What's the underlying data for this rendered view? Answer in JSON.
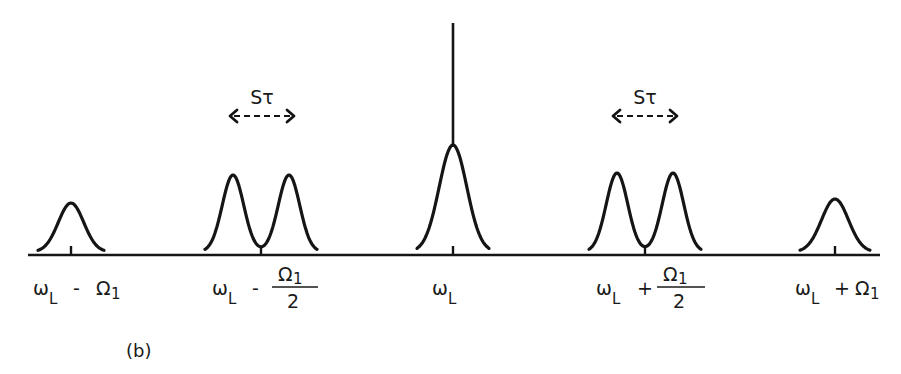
{
  "figure": {
    "panel_label": "(b)",
    "stroke_color": "#151515",
    "background": "#ffffff"
  },
  "axis": {
    "x_start": 28,
    "x_end": 880,
    "y": 255
  },
  "peaks": [
    {
      "id": "left-sideband",
      "centers": [
        71
      ],
      "top_y": 203,
      "half_width": 33,
      "tick_x": 71
    },
    {
      "id": "left-half-doublet",
      "centers": [
        233,
        289
      ],
      "top_y": 175,
      "half_width": 28,
      "tick_x": 261
    },
    {
      "id": "central",
      "centers": [
        453
      ],
      "top_y": 145,
      "half_width": 36,
      "tick_x": 453,
      "spike_top_y": 23
    },
    {
      "id": "right-half-doublet",
      "centers": [
        617,
        673
      ],
      "top_y": 173,
      "half_width": 28,
      "tick_x": 645
    },
    {
      "id": "right-sideband",
      "centers": [
        835
      ],
      "top_y": 199,
      "half_width": 35,
      "tick_x": 835
    }
  ],
  "splitting_arrows": [
    {
      "label": "Sτ",
      "center_x": 262,
      "half_length": 32,
      "y": 116,
      "label_y": 104
    },
    {
      "label": "Sτ",
      "center_x": 645,
      "half_length": 32,
      "y": 116,
      "label_y": 104
    }
  ],
  "labels": [
    {
      "id": "omega-minus-omega1",
      "omega": "ω",
      "sub": "L",
      "op": "-",
      "term": "Ω",
      "term_sub": "1",
      "fraction": false,
      "x": 33
    },
    {
      "id": "omega-minus-half-omega1",
      "omega": "ω",
      "sub": "L",
      "op": "-",
      "term": "Ω",
      "term_sub": "1",
      "fraction": true,
      "denominator": "2",
      "x": 212
    },
    {
      "id": "omega-L",
      "omega": "ω",
      "sub": "L",
      "op": "",
      "term": "",
      "term_sub": "",
      "fraction": false,
      "x": 432
    },
    {
      "id": "omega-plus-half-omega1",
      "omega": "ω",
      "sub": "L",
      "op": "+",
      "term": "Ω",
      "term_sub": "1",
      "fraction": true,
      "denominator": "2",
      "x": 596
    },
    {
      "id": "omega-plus-omega1",
      "omega": "ω",
      "sub": "L",
      "op": "+",
      "term": "Ω",
      "term_sub": "1",
      "fraction": false,
      "x": 795
    }
  ],
  "text": {
    "sigma_tau": "Sτ",
    "label_0": {
      "omega": "ω",
      "sub": "L",
      "op": "-",
      "term": "Ω",
      "term_sub": "1"
    },
    "label_1": {
      "omega": "ω",
      "sub": "L",
      "op": "-",
      "num": "Ω",
      "num_sub": "1",
      "den": "2"
    },
    "label_2": {
      "omega": "ω",
      "sub": "L"
    },
    "label_3": {
      "omega": "ω",
      "sub": "L",
      "op": "+",
      "num": "Ω",
      "num_sub": "1",
      "den": "2"
    },
    "label_4": {
      "omega": "ω",
      "sub": "L",
      "op": "+",
      "term": "Ω",
      "term_sub": "1"
    }
  }
}
